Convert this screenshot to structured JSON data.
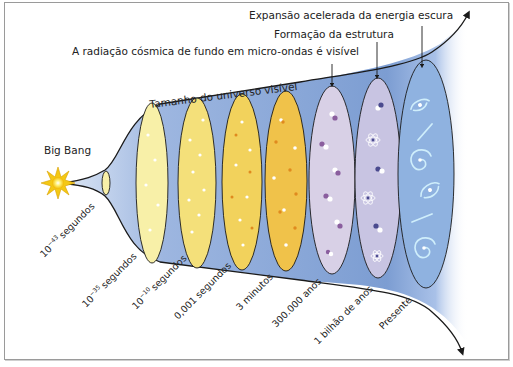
{
  "diagram": {
    "title_axis_label": "Tamanho do universo visível",
    "start_label": "Big Bang",
    "annotations": [
      {
        "id": "cmb",
        "text": "A radiação cósmica de fundo em micro-ondas é visível"
      },
      {
        "id": "structure",
        "text": "Formação da estrutura"
      },
      {
        "id": "dark_energy",
        "text": "Expansão acelerada da energia escura"
      }
    ],
    "epochs": [
      {
        "base": "10",
        "exp": "−43",
        "unit": "segundos"
      },
      {
        "base": "10",
        "exp": "−35",
        "unit": "segundos"
      },
      {
        "base": "10",
        "exp": "−10",
        "unit": "segundos"
      },
      {
        "base": "",
        "exp": "",
        "unit": "0,001 segundos"
      },
      {
        "base": "",
        "exp": "",
        "unit": "3 minutos"
      },
      {
        "base": "",
        "exp": "",
        "unit": "300.000 anos"
      },
      {
        "base": "",
        "exp": "",
        "unit": "1 bilhão de anos"
      },
      {
        "base": "",
        "exp": "",
        "unit": "Presente"
      }
    ],
    "colors": {
      "funnel_blue": "#7f9fd3",
      "early_pale_yellow": "#f8f0a8",
      "yellow": "#f2d862",
      "orange_yellow": "#f0c24a",
      "lavender": "#d8d0e6",
      "lilac": "#c8c4e2",
      "present_blue": "#8fb2e0",
      "star": "#f7d21e",
      "outline": "#1a1a1a"
    }
  }
}
